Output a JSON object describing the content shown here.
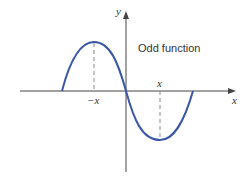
{
  "diagram": {
    "title": "Odd function",
    "x_axis_label": "x",
    "y_axis_label": "y",
    "tick_labels": {
      "negative": "−x",
      "positive": "x"
    },
    "colors": {
      "curve": "#3a56a8",
      "axis": "#444444",
      "dashed": "#888888"
    }
  }
}
